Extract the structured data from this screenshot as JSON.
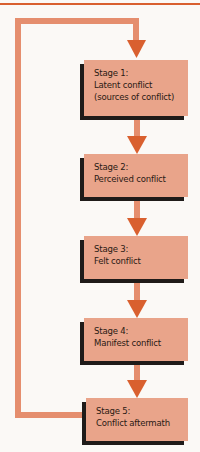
{
  "diagram": {
    "type": "flowchart",
    "direction": "top-to-bottom",
    "colors": {
      "box_fill": "#e9a48a",
      "box_shadow": "#1f1b19",
      "text": "#2a1a14",
      "connector": "#e58e6e",
      "arrowhead": "#d9602f",
      "top_rule": "#d9602f",
      "background": "#fbf9f6"
    },
    "stages": [
      {
        "id": "stage-1",
        "number_label": "Stage 1:",
        "lines": [
          "Latent conflict",
          "(sources of conflict)"
        ]
      },
      {
        "id": "stage-2",
        "number_label": "Stage 2:",
        "lines": [
          "Perceived conflict"
        ]
      },
      {
        "id": "stage-3",
        "number_label": "Stage 3:",
        "lines": [
          "Felt conflict"
        ]
      },
      {
        "id": "stage-4",
        "number_label": "Stage 4:",
        "lines": [
          "Manifest conflict"
        ]
      },
      {
        "id": "stage-5",
        "number_label": "Stage 5:",
        "lines": [
          "Conflict aftermath"
        ]
      }
    ],
    "edges": [
      {
        "from": "stage-1",
        "to": "stage-2"
      },
      {
        "from": "stage-2",
        "to": "stage-3"
      },
      {
        "from": "stage-3",
        "to": "stage-4"
      },
      {
        "from": "stage-4",
        "to": "stage-5"
      },
      {
        "from": "stage-5",
        "to": "stage-1",
        "kind": "feedback-loop"
      }
    ]
  }
}
